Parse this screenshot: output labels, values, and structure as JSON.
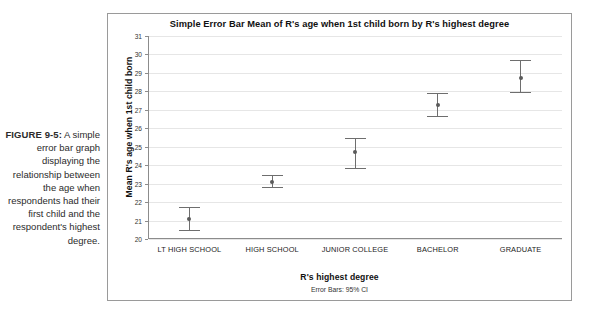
{
  "caption": {
    "figure_label": "FIGURE 9-5:",
    "text": "A simple error bar graph displaying the relationship between the age when respondents had their first child and the respondent's highest degree."
  },
  "chart_data": {
    "type": "scatter",
    "title": "Simple Error Bar Mean of R's age when 1st child born by R's highest degree",
    "xlabel": "R's highest degree",
    "ylabel": "Mean R's age when 1st child born",
    "footnote": "Error Bars: 95% CI",
    "categories": [
      "LT HIGH SCHOOL",
      "HIGH SCHOOL",
      "JUNIOR COLLEGE",
      "BACHELOR",
      "GRADUATE"
    ],
    "values": [
      21.1,
      23.1,
      24.7,
      27.25,
      28.75
    ],
    "ci_lower": [
      20.5,
      22.8,
      23.85,
      26.65,
      27.95
    ],
    "ci_upper": [
      21.75,
      23.45,
      25.5,
      27.9,
      29.7
    ],
    "ylim": [
      20,
      31
    ],
    "yticks": [
      20,
      21,
      22,
      23,
      24,
      25,
      26,
      27,
      28,
      29,
      30,
      31
    ],
    "grid": true,
    "legend": "none",
    "marker_color": "#5a5a5a",
    "errorbar_color": "#6e6e6e",
    "gridline_color": "#e6e6e6"
  }
}
